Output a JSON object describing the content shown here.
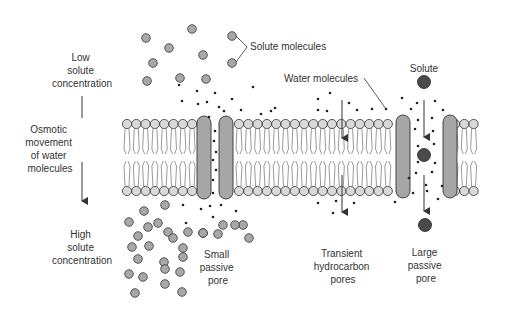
{
  "colors": {
    "head_fill": "#d9d9d9",
    "solute_fill": "#a8a8a8",
    "large_solute_fill": "#4a4a4a",
    "pore_fill": "#a6a6a6",
    "stroke": "#333333",
    "text": "#333333"
  },
  "labels": {
    "low_concentration": [
      "Low",
      "solute",
      "concentration"
    ],
    "osmotic_movement": [
      "Osmotic",
      "movement",
      "of water",
      "molecules"
    ],
    "high_concentration": [
      "High",
      "solute",
      "concentration"
    ],
    "solute_molecules": "Solute molecules",
    "water_molecules": "Water molecules",
    "solute": "Solute",
    "small_pore": [
      "Small",
      "passive",
      "pore"
    ],
    "transient_pores": [
      "Transient",
      "hydrocarbon",
      "pores"
    ],
    "large_pore": [
      "Large",
      "passive",
      "pore"
    ]
  }
}
